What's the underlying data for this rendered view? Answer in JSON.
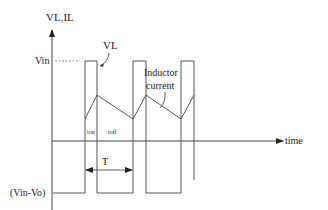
{
  "diagram": {
    "y_axis_label": "VL,IL",
    "x_axis_label": "time",
    "levels": {
      "high": "Vin",
      "low": "(Vin-Vo)"
    },
    "signals": [
      {
        "name": "VL",
        "label": "VL",
        "shape": "square-wave"
      },
      {
        "name": "inductor-current",
        "label_line1": "Inductor",
        "label_line2": "current",
        "shape": "triangle-wave"
      }
    ],
    "intervals": {
      "on": "ton",
      "off": "toff",
      "period": "T"
    },
    "cycles_shown": 3,
    "colors": {
      "lines": "#555555",
      "text": "#1a1a1a"
    }
  }
}
